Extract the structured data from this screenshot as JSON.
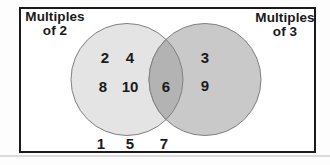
{
  "diagram": {
    "left_label": {
      "line1": "Multiples",
      "line2": "of 2"
    },
    "right_label": {
      "line1": "Multiples",
      "line2": "of 3"
    },
    "left_only": [
      "2",
      "4",
      "8",
      "10"
    ],
    "intersection": [
      "6"
    ],
    "right_only": [
      "3",
      "9"
    ],
    "outside": [
      "1",
      "5",
      "7"
    ]
  },
  "colors": {
    "left_circle_fill": "#e4e4e4",
    "right_circle_fill": "#c9c9c9",
    "overlap_fill": "#b3b3b3",
    "circle_outline": "#808080",
    "frame_border": "#1b1b1b",
    "text": "#1a1a1a"
  }
}
